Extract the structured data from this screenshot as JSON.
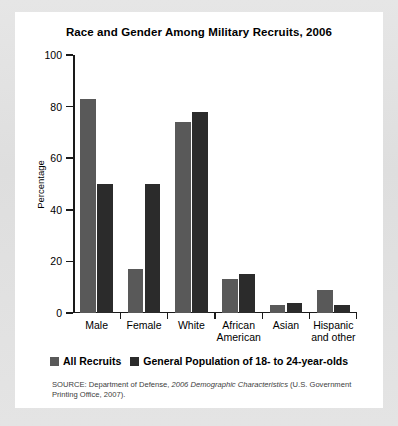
{
  "chart_data": {
    "type": "bar",
    "title": "Race and Gender Among Military Recruits, 2006",
    "xlabel": "",
    "ylabel": "Percentage",
    "ylim": [
      0,
      100
    ],
    "yticks": [
      0,
      20,
      40,
      60,
      80,
      100
    ],
    "grid": false,
    "legend_position": "bottom",
    "categories": [
      "Male",
      "Female",
      "White",
      "African American",
      "Asian",
      "Hispanic and other"
    ],
    "category_lines": [
      [
        "Male"
      ],
      [
        "Female"
      ],
      [
        "White"
      ],
      [
        "African",
        "American"
      ],
      [
        "Asian"
      ],
      [
        "Hispanic",
        "and other"
      ]
    ],
    "series": [
      {
        "name": "All Recruits",
        "color": "#595959",
        "values": [
          83,
          17,
          74,
          13,
          3,
          9
        ]
      },
      {
        "name": "General Population of 18- to 24-year-olds",
        "color": "#2b2b2b",
        "values": [
          50,
          50,
          78,
          15,
          4,
          3
        ]
      }
    ],
    "source_note": {
      "prefix": "SOURCE: Department of Defense, ",
      "italic": "2006 Demographic Characteristics",
      "suffix": " (U.S. Government Printing Office, 2007)."
    }
  },
  "colors": {
    "page_background": "#e2e2e2",
    "card_background": "#ffffff",
    "axis": "#1a1a1a",
    "series_all_recruits": "#595959",
    "series_general_population": "#2b2b2b"
  }
}
